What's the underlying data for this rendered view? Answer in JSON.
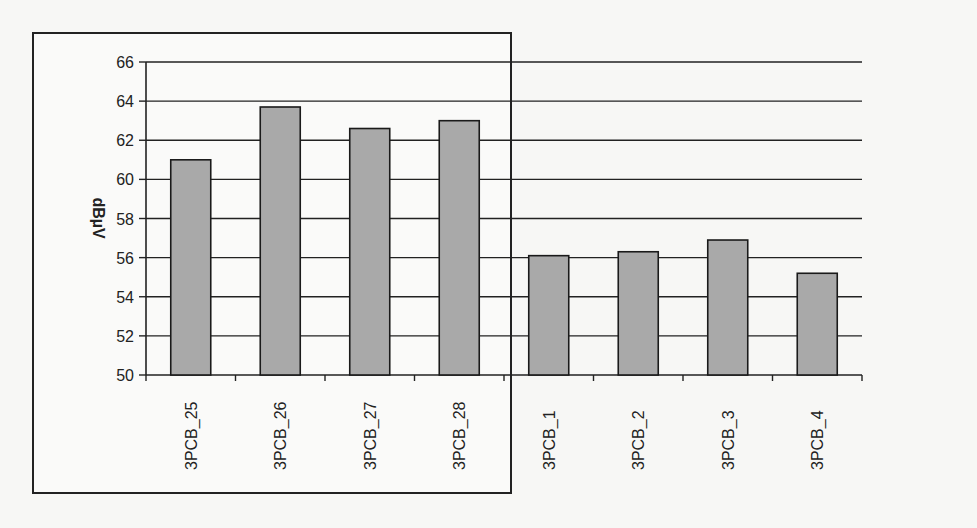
{
  "chart_data": {
    "type": "bar",
    "title": "",
    "xlabel": "",
    "ylabel": "dBµV",
    "ylim": [
      50,
      66
    ],
    "yticks": [
      50,
      52,
      54,
      56,
      58,
      60,
      62,
      64,
      66
    ],
    "grid": true,
    "legend": null,
    "categories": [
      "3PCB_25",
      "3PCB_26",
      "3PCB_27",
      "3PCB_28",
      "3PCB_1",
      "3PCB_2",
      "3PCB_3",
      "3PCB_4"
    ],
    "values": [
      61.0,
      63.7,
      62.6,
      63.0,
      56.1,
      56.3,
      56.9,
      55.2
    ],
    "bar_color": "#a9a9a9"
  },
  "ytick_labels": [
    "66",
    "64",
    "62",
    "60",
    "58",
    "56",
    "54",
    "52",
    "50"
  ],
  "ylabel": "dBµV"
}
